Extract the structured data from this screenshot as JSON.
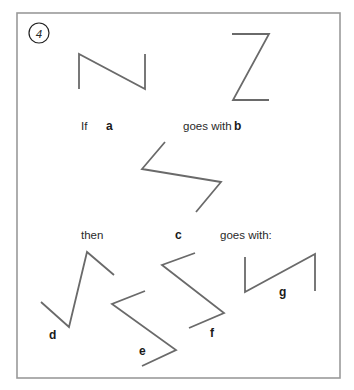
{
  "puzzle": {
    "number": "4",
    "frame": {
      "x": 17,
      "y": 13,
      "width": 323,
      "height": 365,
      "color": "#9a9a9a"
    },
    "line_color": "#6a6a6a",
    "text": {
      "if": "If",
      "goes_with_1": "goes with",
      "then": "then",
      "goes_with_2": "goes with:"
    },
    "shapes": {
      "a": {
        "label": "a",
        "points": "79,89 79,54 145,89 145,54",
        "label_pos": [
          106,
          130
        ]
      },
      "b": {
        "label": "b",
        "points": "232,34 269,34 233,100 269,100",
        "label_pos": [
          234,
          130
        ]
      },
      "c": {
        "label": "c",
        "points": "165,142 142,169 221,182 196,212",
        "label_pos": [
          175,
          239
        ]
      },
      "d": {
        "label": "d",
        "points": "41,302 69,327 87,252 114,275",
        "label_pos": [
          49,
          339
        ]
      },
      "e": {
        "label": "e",
        "points": "145,291 112,304 176,350 142,366",
        "label_pos": [
          139,
          355
        ]
      },
      "f": {
        "label": "f",
        "points": "195,253 162,265 224,313 189,328",
        "label_pos": [
          210,
          337
        ]
      },
      "g": {
        "label": "g",
        "points": "245,257 245,292 315,254 315,291",
        "label_pos": [
          279,
          296
        ]
      }
    }
  }
}
